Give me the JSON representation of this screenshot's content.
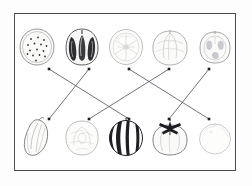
{
  "page": {
    "frame_border_color": "#4a4a52",
    "background_color": "#ffffff",
    "line_color": "#5a5a62",
    "dot_color": "#1d1d22"
  },
  "top_row": {
    "label": "top row of produce illustrations",
    "items": [
      {
        "index": 1,
        "name": "kiwi-slice",
        "label": "kiwi slice",
        "icon": "kiwi-slice-icon"
      },
      {
        "index": 2,
        "name": "bell-pepper-cross-section",
        "label": "bell pepper cross section",
        "icon": "pepper-cross-section-icon"
      },
      {
        "index": 3,
        "name": "orange-slice",
        "label": "orange slice",
        "icon": "orange-slice-icon"
      },
      {
        "index": 4,
        "name": "cabbage-cross-section",
        "label": "cabbage cross section",
        "icon": "cabbage-cross-section-icon"
      },
      {
        "index": 5,
        "name": "tomato-cross-section",
        "label": "tomato cross section",
        "icon": "tomato-cross-section-icon"
      }
    ]
  },
  "bottom_row": {
    "label": "bottom row of produce illustrations",
    "items": [
      {
        "index": 1,
        "name": "whole-pepper",
        "label": "whole green pepper",
        "icon": "whole-pepper-icon"
      },
      {
        "index": 2,
        "name": "whole-cabbage",
        "label": "whole cabbage",
        "icon": "whole-cabbage-icon"
      },
      {
        "index": 3,
        "name": "whole-watermelon",
        "label": "whole striped watermelon",
        "icon": "whole-watermelon-icon"
      },
      {
        "index": 4,
        "name": "whole-tomato",
        "label": "whole tomato with stem",
        "icon": "whole-tomato-icon"
      },
      {
        "index": 5,
        "name": "whole-orange",
        "label": "whole orange",
        "icon": "whole-orange-icon"
      }
    ]
  },
  "connections": {
    "label": "drawn matching lines between rows",
    "dot_radius": 1.3,
    "top_dots_y": 55,
    "bottom_dots_y": 105,
    "column_x": [
      34,
      74,
      114,
      154,
      194
    ],
    "links": [
      {
        "id": "link-1",
        "from_top": 1,
        "to_bottom": 3,
        "label": "kiwi slice to watermelon"
      },
      {
        "id": "link-2",
        "from_top": 2,
        "to_bottom": 1,
        "label": "pepper cross section to whole pepper"
      },
      {
        "id": "link-3",
        "from_top": 3,
        "to_bottom": 5,
        "label": "orange slice to whole orange"
      },
      {
        "id": "link-4",
        "from_top": 4,
        "to_bottom": 2,
        "label": "cabbage cross section to whole cabbage"
      },
      {
        "id": "link-5",
        "from_top": 5,
        "to_bottom": 4,
        "label": "tomato cross section to whole tomato"
      }
    ]
  }
}
